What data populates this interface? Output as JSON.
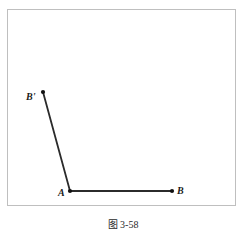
{
  "figure": {
    "caption": "图 3-58",
    "frame": {
      "x": 7,
      "y": 9,
      "width": 229,
      "height": 197,
      "border_color": "#bfbfbf"
    },
    "background_color": "#ffffff",
    "stroke_color": "#2b2b2b",
    "point_color": "#111111"
  },
  "diagram_data": {
    "type": "geometry",
    "description": "Angle formed by ray AB and segment AB-prime",
    "points": [
      {
        "id": "A",
        "label": "A",
        "x": 70,
        "y": 191,
        "label_dx": -12,
        "label_dy": -3
      },
      {
        "id": "B",
        "label": "B",
        "x": 172,
        "y": 191,
        "label_dx": 5,
        "label_dy": -5
      },
      {
        "id": "Bp",
        "label": "B'",
        "x": 43,
        "y": 92,
        "label_dx": -17,
        "label_dy": 0
      }
    ],
    "segments": [
      {
        "from": "A",
        "to": "B",
        "stroke": "#2b2b2b",
        "width": 1.8
      },
      {
        "from": "A",
        "to": "Bp",
        "stroke": "#2b2b2b",
        "width": 1.8
      }
    ],
    "labels": {
      "a": "A",
      "b": "B",
      "b_prime": "B'"
    }
  }
}
